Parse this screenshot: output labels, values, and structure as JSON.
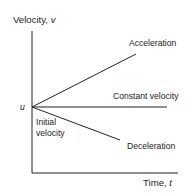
{
  "diagram": {
    "y_axis": {
      "label": "Velocity, ",
      "variable": "v"
    },
    "x_axis": {
      "label": "Time, ",
      "variable": "t"
    },
    "origin_label": "u",
    "origin_caption": [
      "Initial",
      "velocity"
    ],
    "lines": [
      {
        "name": "Acceleration",
        "label": "Acceleration"
      },
      {
        "name": "Constant velocity",
        "label": "Constant velocity"
      },
      {
        "name": "Deceleration",
        "label": "Deceleration"
      }
    ],
    "colors": {
      "line": "#222222",
      "text": "#222222",
      "background": "#ffffff"
    }
  }
}
